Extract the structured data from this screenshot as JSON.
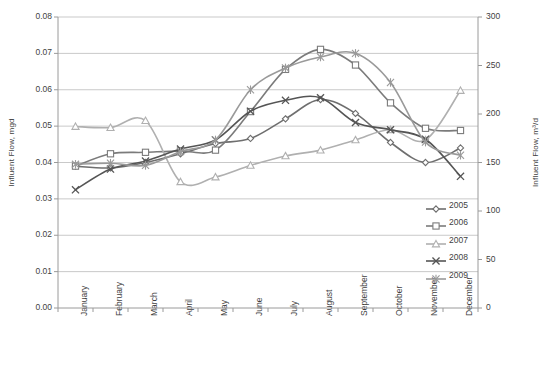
{
  "chart_data": {
    "type": "line",
    "title": "",
    "categories": [
      "January",
      "February",
      "March",
      "April",
      "May",
      "June",
      "July",
      "August",
      "September",
      "October",
      "November",
      "December"
    ],
    "xlabel": "",
    "ylabel": "Influent Flow, mgd",
    "y2label": "Influent Flow, m³/d",
    "ylim": [
      0.0,
      0.08
    ],
    "y2lim": [
      0,
      300
    ],
    "yticks": [
      "0.00",
      "0.01",
      "0.02",
      "0.03",
      "0.04",
      "0.05",
      "0.06",
      "0.07",
      "0.08"
    ],
    "y2ticks": [
      "0",
      "50",
      "100",
      "150",
      "200",
      "250",
      "300"
    ],
    "grid": true,
    "legend_position": "right-inside",
    "series": [
      {
        "name": "2005",
        "marker": "diamond",
        "color": "#6f6f6f",
        "values": [
          0.039,
          0.0385,
          0.04,
          0.0424,
          0.0452,
          0.0466,
          0.052,
          0.0573,
          0.0535,
          0.0455,
          0.04,
          0.044
        ]
      },
      {
        "name": "2006",
        "marker": "square",
        "color": "#7b7b7b",
        "values": [
          0.039,
          0.0424,
          0.0428,
          0.0432,
          0.0434,
          0.054,
          0.0656,
          0.0711,
          0.0668,
          0.0564,
          0.0494,
          0.0488
        ]
      },
      {
        "name": "2007",
        "marker": "triangle",
        "color": "#b0b0b0",
        "values": [
          0.0499,
          0.0496,
          0.0515,
          0.0347,
          0.036,
          0.0392,
          0.0418,
          0.0434,
          0.0462,
          0.049,
          0.0462,
          0.0598
        ]
      },
      {
        "name": "2008",
        "marker": "cross",
        "color": "#555555",
        "values": [
          0.0325,
          0.0382,
          0.0404,
          0.0437,
          0.0462,
          0.0541,
          0.0571,
          0.0578,
          0.051,
          0.049,
          0.0464,
          0.0362
        ]
      },
      {
        "name": "2009",
        "marker": "asterisk",
        "color": "#9a9a9a",
        "values": [
          0.0395,
          0.0398,
          0.0392,
          0.043,
          0.0462,
          0.06,
          0.066,
          0.069,
          0.07,
          0.062,
          0.0456,
          0.042
        ]
      }
    ]
  }
}
